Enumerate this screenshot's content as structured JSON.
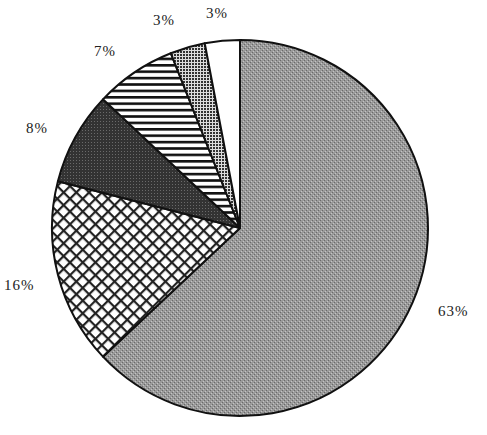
{
  "chart_data": {
    "type": "pie",
    "title": "",
    "start_angle_deg": 0,
    "direction": "clockwise",
    "slices": [
      {
        "label": "63%",
        "value": 63,
        "pattern": "stipple-gray",
        "color": "#8f8f8f"
      },
      {
        "label": "16%",
        "value": 16,
        "pattern": "crosshatch",
        "color": "#ffffff"
      },
      {
        "label": "8%",
        "value": 8,
        "pattern": "dark-stipple",
        "color": "#3a3a3a"
      },
      {
        "label": "7%",
        "value": 7,
        "pattern": "horizontal-stripes",
        "color": "#ffffff"
      },
      {
        "label": "3%",
        "value": 3,
        "pattern": "dense-dots",
        "color": "#555555"
      },
      {
        "label": "3%",
        "value": 3,
        "pattern": "solid-white",
        "color": "#ffffff"
      }
    ],
    "label_positions": [
      {
        "x": 438,
        "y": 316
      },
      {
        "x": 4,
        "y": 290
      },
      {
        "x": 26,
        "y": 133
      },
      {
        "x": 94,
        "y": 56
      },
      {
        "x": 153,
        "y": 25
      },
      {
        "x": 206,
        "y": 18
      }
    ],
    "legend": null
  }
}
